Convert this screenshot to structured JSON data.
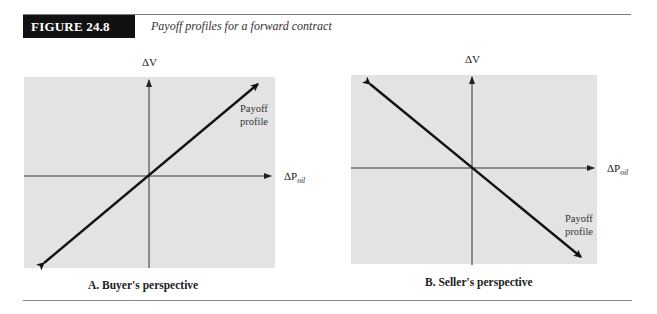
{
  "figure": {
    "number_label": "FIGURE 24.8",
    "title": "Payoff profiles for a forward contract"
  },
  "panels": [
    {
      "id": "A",
      "caption": "A. Buyer's perspective",
      "y_axis_label": "ΔV",
      "x_axis_label_main": "ΔP",
      "x_axis_label_sub": "oil",
      "line_label_1": "Payoff",
      "line_label_2": "profile",
      "slope": "positive"
    },
    {
      "id": "B",
      "caption": "B. Seller's perspective",
      "y_axis_label": "ΔV",
      "x_axis_label_main": "ΔP",
      "x_axis_label_sub": "oil",
      "line_label_1": "Payoff",
      "line_label_2": "profile",
      "slope": "negative"
    }
  ],
  "colors": {
    "panel_background": "#e3e3e3",
    "line": "#111111",
    "axis": "#333333",
    "label_box": "#111111"
  }
}
